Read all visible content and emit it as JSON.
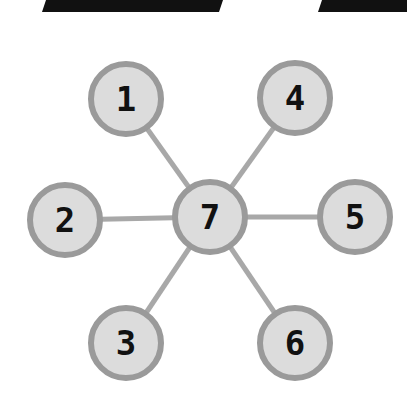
{
  "diagram": {
    "type": "star-graph",
    "colors": {
      "node_fill": "#dcdcdc",
      "node_stroke": "#9a9a9a",
      "edge": "#a8a8a8",
      "label": "#111111",
      "top_bars": "#111111"
    },
    "top_bars": [
      {
        "points": "46,0 223,0 219,12 42,12"
      },
      {
        "points": "322,0 407,0 407,12 318,12"
      }
    ],
    "nodes": [
      {
        "id": "1",
        "label": "1",
        "cx": 126,
        "cy": 99
      },
      {
        "id": "2",
        "label": "2",
        "cx": 65,
        "cy": 220
      },
      {
        "id": "3",
        "label": "3",
        "cx": 126,
        "cy": 343
      },
      {
        "id": "4",
        "label": "4",
        "cx": 295,
        "cy": 98
      },
      {
        "id": "5",
        "label": "5",
        "cx": 355,
        "cy": 217
      },
      {
        "id": "6",
        "label": "6",
        "cx": 295,
        "cy": 343
      },
      {
        "id": "7",
        "label": "7",
        "cx": 210,
        "cy": 217
      }
    ],
    "edges": [
      {
        "from": "7",
        "to": "1"
      },
      {
        "from": "7",
        "to": "2"
      },
      {
        "from": "7",
        "to": "3"
      },
      {
        "from": "7",
        "to": "4"
      },
      {
        "from": "7",
        "to": "5"
      },
      {
        "from": "7",
        "to": "6"
      }
    ],
    "node_radius": 35
  }
}
